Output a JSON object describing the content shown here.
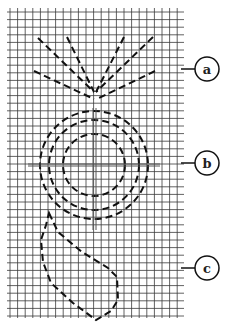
{
  "diagram": {
    "grid": {
      "x0": 10,
      "y0": 8,
      "x1": 181,
      "y1": 318,
      "step": 7.6,
      "color": "#444444"
    },
    "callouts": [
      {
        "id": "a",
        "label": "a",
        "cx": 207,
        "cy": 69,
        "line_y": 69
      },
      {
        "id": "b",
        "label": "b",
        "cx": 207,
        "cy": 163,
        "line_y": 163
      },
      {
        "id": "c",
        "label": "c",
        "cx": 207,
        "cy": 268,
        "line_y": 268
      }
    ],
    "shapes": {
      "a": "fan of five dashed rays converging at a point",
      "b": "three concentric dashed circles with crosshair",
      "c": "dashed teardrop shape"
    }
  }
}
